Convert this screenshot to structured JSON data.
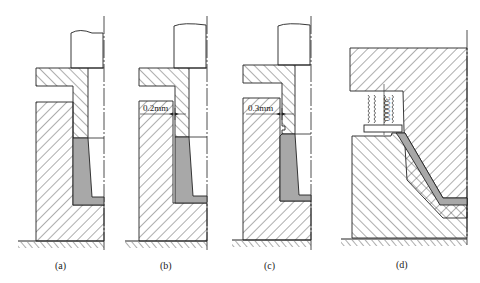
{
  "figure": {
    "panels": [
      {
        "id": "a",
        "label": "(a)",
        "dimension": null
      },
      {
        "id": "b",
        "label": "(b)",
        "dimension": "0.2mm"
      },
      {
        "id": "c",
        "label": "(c)",
        "dimension": "0.3mm"
      },
      {
        "id": "d",
        "label": "(d)",
        "dimension": null
      }
    ],
    "colors": {
      "line": "#222222",
      "hatch": "#333333",
      "fill_gray": "#a8a8a8",
      "background": "#ffffff"
    }
  }
}
